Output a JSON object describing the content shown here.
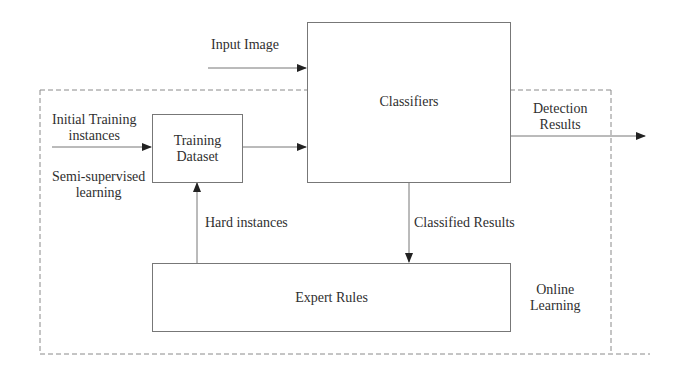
{
  "diagram": {
    "nodes": {
      "classifiers": {
        "label": "Classifiers"
      },
      "training_dataset": {
        "label_line1": "Training",
        "label_line2": "Dataset"
      },
      "expert_rules": {
        "label": "Expert Rules"
      }
    },
    "edge_labels": {
      "input_image": "Input Image",
      "initial_training_line1": "Initial Training",
      "initial_training_line2": "instances",
      "semi_supervised_line1": "Semi-supervised",
      "semi_supervised_line2": "learning",
      "detection_line1": "Detection",
      "detection_line2": "Results",
      "hard_instances": "Hard instances",
      "classified_results": "Classified Results",
      "online_line1": "Online",
      "online_line2": "Learning"
    },
    "edges": [
      {
        "from": "input",
        "to": "classifiers",
        "label": "Input Image"
      },
      {
        "from": "initial_training_instances",
        "to": "training_dataset",
        "label": "Initial Training instances"
      },
      {
        "from": "training_dataset",
        "to": "classifiers",
        "label": ""
      },
      {
        "from": "classifiers",
        "to": "output",
        "label": "Detection Results"
      },
      {
        "from": "classifiers",
        "to": "expert_rules",
        "label": "Classified Results"
      },
      {
        "from": "expert_rules",
        "to": "training_dataset",
        "label": "Hard instances"
      }
    ],
    "regions": [
      {
        "name": "online-learning-region",
        "label": "Online Learning",
        "style": "dashed"
      }
    ],
    "colors": {
      "line": "#777777",
      "dashed": "#8a8a8a",
      "arrowhead": "#222222",
      "text": "#2f2f2f"
    }
  }
}
